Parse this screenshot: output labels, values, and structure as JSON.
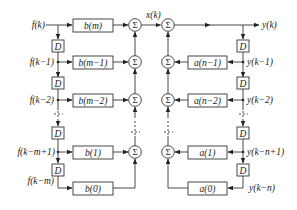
{
  "diagram": {
    "type": "block-diagram",
    "title": "",
    "sum_symbol": "Σ",
    "delay_label": "D",
    "intermediate_signal": "x(k)",
    "output_signal": "y(k)",
    "left_inputs": [
      "f(k)",
      "f(k−1)",
      "f(k−2)",
      "f(k−m+1)",
      "f(k−m)"
    ],
    "b_coeffs": [
      "b(m)",
      "b(m−1)",
      "b(m−2)",
      "b(1)",
      "b(0)"
    ],
    "a_coeffs": [
      "a(n−1)",
      "a(n−2)",
      "a(1)",
      "a(0)"
    ],
    "right_taps": [
      "y(k−1)",
      "y(k−2)",
      "y(k−n+1)",
      "y(k−n)"
    ]
  }
}
